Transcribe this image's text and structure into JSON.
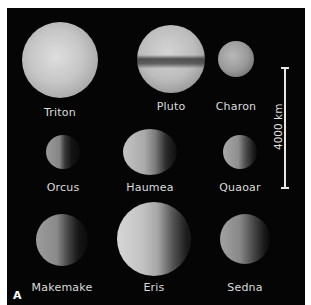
{
  "figure": {
    "panel_label": "A",
    "scale_bar": {
      "label": "4000 km",
      "length_km": 4000
    },
    "bodies": [
      {
        "name": "Triton",
        "row": 1,
        "col": 1,
        "cx": 60,
        "cy": 60,
        "rx": 38,
        "ry": 38,
        "tone": "#c9c9c9",
        "shade": "full"
      },
      {
        "name": "Pluto",
        "row": 1,
        "col": 2,
        "cx": 171,
        "cy": 59,
        "rx": 34,
        "ry": 34,
        "tone": "#b5b5b5",
        "shade": "banded"
      },
      {
        "name": "Charon",
        "row": 1,
        "col": 3,
        "cx": 236,
        "cy": 59,
        "rx": 18,
        "ry": 18,
        "tone": "#9a9a9a",
        "shade": "full"
      },
      {
        "name": "Orcus",
        "row": 2,
        "col": 1,
        "cx": 63,
        "cy": 152,
        "rx": 17,
        "ry": 17,
        "tone": "#858585",
        "shade": "half"
      },
      {
        "name": "Haumea",
        "row": 2,
        "col": 2,
        "cx": 150,
        "cy": 152,
        "rx": 27,
        "ry": 23,
        "tone": "#a9a9a9",
        "shade": "half"
      },
      {
        "name": "Quaoar",
        "row": 2,
        "col": 3,
        "cx": 240,
        "cy": 152,
        "rx": 17,
        "ry": 17,
        "tone": "#8f8f8f",
        "shade": "half"
      },
      {
        "name": "Makemake",
        "row": 3,
        "col": 1,
        "cx": 62,
        "cy": 240,
        "rx": 26,
        "ry": 26,
        "tone": "#8a8a8a",
        "shade": "half"
      },
      {
        "name": "Eris",
        "row": 3,
        "col": 2,
        "cx": 154,
        "cy": 239,
        "rx": 37,
        "ry": 37,
        "tone": "#bdbdbd",
        "shade": "half"
      },
      {
        "name": "Sedna",
        "row": 3,
        "col": 3,
        "cx": 245,
        "cy": 239,
        "rx": 25,
        "ry": 25,
        "tone": "#888888",
        "shade": "half"
      }
    ],
    "labels": {
      "triton": "Triton",
      "pluto": "Pluto",
      "charon": "Charon",
      "orcus": "Orcus",
      "haumea": "Haumea",
      "quaoar": "Quaoar",
      "makemake": "Makemake",
      "eris": "Eris",
      "sedna": "Sedna"
    },
    "colors": {
      "background": "#050505",
      "text": "#dcdcdc",
      "frame": "#ffffff"
    }
  }
}
